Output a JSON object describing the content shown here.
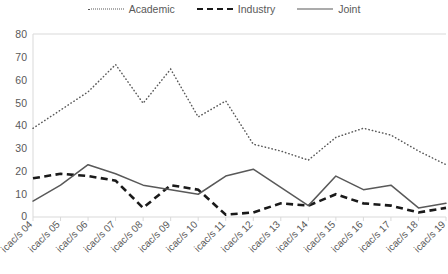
{
  "chart_data": {
    "type": "line",
    "title": "",
    "xlabel": "",
    "ylabel": "",
    "ylim": [
      0,
      80
    ],
    "yticks": [
      0,
      10,
      20,
      30,
      40,
      50,
      60,
      70,
      80
    ],
    "grid": false,
    "legend_position": "top-center",
    "categories": [
      "icac/s 04",
      "icac/s 05",
      "icac/s 06",
      "icac/s 07",
      "icac/s 08",
      "icac/s 09",
      "icac/s 10",
      "icac/s 11",
      "icac/s 12",
      "icac/s 13",
      "icac/s 14",
      "icac/s 15",
      "icac/s 16",
      "icac/s 17",
      "icac/s 18",
      "icac/s 19"
    ],
    "series": [
      {
        "name": "Academic",
        "style": "dotted",
        "color": "#595959",
        "values": [
          39,
          47,
          55,
          67,
          50,
          65,
          44,
          51,
          32,
          29,
          25,
          35,
          39,
          36,
          29,
          23
        ]
      },
      {
        "name": "Industry",
        "style": "dashed",
        "color": "#1a1a1a",
        "values": [
          17,
          19,
          18,
          16,
          4,
          14,
          12,
          1,
          2,
          6,
          5,
          10,
          6,
          5,
          2,
          4
        ]
      },
      {
        "name": "Joint",
        "style": "solid",
        "color": "#595959",
        "values": [
          7,
          14,
          23,
          19,
          14,
          12,
          10,
          18,
          21,
          13,
          5,
          18,
          12,
          14,
          4,
          6
        ]
      }
    ]
  },
  "legend": {
    "items": [
      {
        "label": "Academic",
        "style": "dotted"
      },
      {
        "label": "Industry",
        "style": "dashed"
      },
      {
        "label": "Joint",
        "style": "solid"
      }
    ]
  },
  "axes": {
    "y_tick_labels": [
      "80",
      "70",
      "60",
      "50",
      "40",
      "30",
      "20",
      "10",
      "0"
    ]
  }
}
